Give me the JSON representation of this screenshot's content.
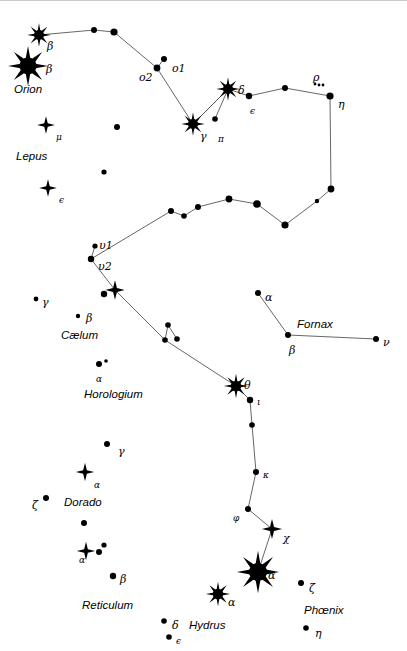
{
  "chart": {
    "width": 407,
    "height": 651,
    "background_color": "#ffffff",
    "ink_color": "#000000",
    "line_color": "#555555"
  },
  "constellation_labels": [
    {
      "name": "Orion",
      "text": "Orion",
      "x": 14,
      "y": 84
    },
    {
      "name": "Lepus",
      "text": "Lepus",
      "x": 16,
      "y": 151
    },
    {
      "name": "Caelum",
      "text": "Cælum",
      "x": 61,
      "y": 330
    },
    {
      "name": "Horologium",
      "text": "Horologium",
      "x": 84,
      "y": 389
    },
    {
      "name": "Fornax",
      "text": "Fornax",
      "x": 297,
      "y": 319
    },
    {
      "name": "Dorado",
      "text": "Dorado",
      "x": 64,
      "y": 497
    },
    {
      "name": "Reticulum",
      "text": "Reticulum",
      "x": 82,
      "y": 600
    },
    {
      "name": "Hydrus",
      "text": "Hydrus",
      "x": 189,
      "y": 620
    },
    {
      "name": "Phoenix",
      "text": "Phœnix",
      "x": 304,
      "y": 605
    }
  ],
  "star_labels": [
    {
      "name": "beta-1",
      "text": "β",
      "x": 47,
      "y": 41,
      "size": "normal"
    },
    {
      "name": "beta-2",
      "text": "β",
      "x": 46,
      "y": 64,
      "size": "normal"
    },
    {
      "name": "omicron-1",
      "text": "o1",
      "x": 172,
      "y": 63,
      "size": "normal"
    },
    {
      "name": "omicron-2",
      "text": "o2",
      "x": 139,
      "y": 72,
      "size": "normal"
    },
    {
      "name": "gamma-eri",
      "text": "γ",
      "x": 200,
      "y": 131,
      "size": "normal"
    },
    {
      "name": "pi-eri",
      "text": "π",
      "x": 218,
      "y": 135,
      "size": "sub"
    },
    {
      "name": "delta-eri",
      "text": "δ",
      "x": 238,
      "y": 85,
      "size": "normal"
    },
    {
      "name": "epsilon-eri",
      "text": "ϵ",
      "x": 250,
      "y": 107,
      "size": "sub"
    },
    {
      "name": "rho-eri",
      "text": "ρ",
      "x": 313,
      "y": 72,
      "size": "normal"
    },
    {
      "name": "eta-eri",
      "text": "η",
      "x": 338,
      "y": 99,
      "size": "normal"
    },
    {
      "name": "mu-lep",
      "text": "μ",
      "x": 56,
      "y": 133,
      "size": "sub"
    },
    {
      "name": "epsilon-lep",
      "text": "ϵ",
      "x": 59,
      "y": 196,
      "size": "sub"
    },
    {
      "name": "upsilon-1",
      "text": "υ1",
      "x": 99,
      "y": 240,
      "size": "normal"
    },
    {
      "name": "upsilon-2",
      "text": "υ2",
      "x": 98,
      "y": 261,
      "size": "normal"
    },
    {
      "name": "gamma-cae",
      "text": "γ",
      "x": 42,
      "y": 297,
      "size": "normal"
    },
    {
      "name": "beta-cae",
      "text": "β",
      "x": 86,
      "y": 313,
      "size": "normal"
    },
    {
      "name": "alpha-hor",
      "text": "α",
      "x": 96,
      "y": 375,
      "size": "sub"
    },
    {
      "name": "alpha-for",
      "text": "α",
      "x": 265,
      "y": 292,
      "size": "normal"
    },
    {
      "name": "beta-for",
      "text": "β",
      "x": 289,
      "y": 345,
      "size": "normal"
    },
    {
      "name": "nu-for",
      "text": "ν",
      "x": 383,
      "y": 337,
      "size": "normal"
    },
    {
      "name": "theta-eri",
      "text": "θ",
      "x": 244,
      "y": 380,
      "size": "normal"
    },
    {
      "name": "iota-eri",
      "text": "ι",
      "x": 257,
      "y": 398,
      "size": "sub"
    },
    {
      "name": "kappa-eri",
      "text": "κ",
      "x": 263,
      "y": 471,
      "size": "sub"
    },
    {
      "name": "phi-eri",
      "text": "φ",
      "x": 233,
      "y": 514,
      "size": "sub"
    },
    {
      "name": "chi-eri",
      "text": "χ",
      "x": 283,
      "y": 533,
      "size": "normal"
    },
    {
      "name": "alpha-eri",
      "text": "α",
      "x": 268,
      "y": 570,
      "size": "normal"
    },
    {
      "name": "gamma-dor",
      "text": "γ",
      "x": 118,
      "y": 446,
      "size": "normal"
    },
    {
      "name": "alpha-dor",
      "text": "α",
      "x": 94,
      "y": 481,
      "size": "sub"
    },
    {
      "name": "zeta-dor",
      "text": "ζ",
      "x": 32,
      "y": 500,
      "size": "normal"
    },
    {
      "name": "alpha-ret",
      "text": "α",
      "x": 79,
      "y": 556,
      "size": "sub"
    },
    {
      "name": "beta-ret",
      "text": "β",
      "x": 120,
      "y": 574,
      "size": "normal"
    },
    {
      "name": "alpha-hyi",
      "text": "α",
      "x": 228,
      "y": 597,
      "size": "normal"
    },
    {
      "name": "delta-hyi",
      "text": "δ",
      "x": 172,
      "y": 620,
      "size": "normal"
    },
    {
      "name": "epsilon-hyi",
      "text": "ϵ",
      "x": 176,
      "y": 637,
      "size": "sub"
    },
    {
      "name": "zeta-phe",
      "text": "ζ",
      "x": 309,
      "y": 583,
      "size": "normal"
    },
    {
      "name": "eta-phe",
      "text": "η",
      "x": 315,
      "y": 628,
      "size": "normal"
    }
  ],
  "chart_data": {
    "type": "scatter",
    "xlabel": "",
    "ylabel": "",
    "xlim": [
      0,
      407
    ],
    "ylim": [
      0,
      651
    ],
    "grid": false,
    "legend": "none",
    "stars": [
      {
        "id": "s-beta-ori",
        "label": "β",
        "x": 39,
        "y": 35,
        "r": 5.0,
        "style": "spiked"
      },
      {
        "id": "s-beta-ori-b",
        "label": "β",
        "x": 28,
        "y": 66,
        "r": 8.5,
        "style": "spiked"
      },
      {
        "id": "s-eri-a",
        "label": "",
        "x": 94,
        "y": 30,
        "r": 3.0,
        "style": "dot"
      },
      {
        "id": "s-eri-b",
        "label": "",
        "x": 114,
        "y": 32,
        "r": 3.6,
        "style": "dot"
      },
      {
        "id": "s-omi-1",
        "label": "o1",
        "x": 164,
        "y": 59,
        "r": 3.0,
        "style": "dot"
      },
      {
        "id": "s-omi-2",
        "label": "o2",
        "x": 157,
        "y": 68,
        "r": 3.4,
        "style": "dot"
      },
      {
        "id": "s-gamma-eri",
        "label": "γ",
        "x": 193,
        "y": 124,
        "r": 5.0,
        "style": "spiked"
      },
      {
        "id": "s-pi-eri",
        "label": "π",
        "x": 215,
        "y": 119,
        "r": 2.8,
        "style": "dot"
      },
      {
        "id": "s-delta-eri",
        "label": "δ",
        "x": 228,
        "y": 89,
        "r": 5.0,
        "style": "spiked"
      },
      {
        "id": "s-eps-eri",
        "label": "ϵ",
        "x": 249,
        "y": 96,
        "r": 3.2,
        "style": "dot"
      },
      {
        "id": "s-eri-c",
        "label": "",
        "x": 285,
        "y": 88,
        "r": 3.0,
        "style": "dot"
      },
      {
        "id": "s-eta-eri",
        "label": "η",
        "x": 330,
        "y": 96,
        "r": 3.6,
        "style": "dot"
      },
      {
        "id": "s-mu-lep",
        "label": "μ",
        "x": 46,
        "y": 125,
        "r": 4.2,
        "style": "diamond"
      },
      {
        "id": "s-eps-lep",
        "label": "ϵ",
        "x": 48,
        "y": 188,
        "r": 4.2,
        "style": "diamond"
      },
      {
        "id": "s-lep-a",
        "label": "",
        "x": 117,
        "y": 127,
        "r": 3.0,
        "style": "dot"
      },
      {
        "id": "s-lep-b",
        "label": "",
        "x": 104,
        "y": 172,
        "r": 2.6,
        "style": "dot"
      },
      {
        "id": "s-eri-d",
        "label": "",
        "x": 331,
        "y": 189,
        "r": 3.4,
        "style": "dot"
      },
      {
        "id": "s-eri-e",
        "label": "",
        "x": 317,
        "y": 201,
        "r": 2.2,
        "style": "dot"
      },
      {
        "id": "s-eri-f",
        "label": "",
        "x": 285,
        "y": 225,
        "r": 3.6,
        "style": "dot"
      },
      {
        "id": "s-eri-g",
        "label": "",
        "x": 257,
        "y": 204,
        "r": 3.8,
        "style": "dot"
      },
      {
        "id": "s-eri-h",
        "label": "",
        "x": 229,
        "y": 199,
        "r": 3.4,
        "style": "dot"
      },
      {
        "id": "s-eri-i",
        "label": "",
        "x": 198,
        "y": 207,
        "r": 3.0,
        "style": "dot"
      },
      {
        "id": "s-eri-j",
        "label": "",
        "x": 184,
        "y": 216,
        "r": 2.8,
        "style": "dot"
      },
      {
        "id": "s-eri-k",
        "label": "",
        "x": 171,
        "y": 211,
        "r": 3.0,
        "style": "dot"
      },
      {
        "id": "s-ups-1",
        "label": "υ1",
        "x": 95,
        "y": 246,
        "r": 2.6,
        "style": "dot"
      },
      {
        "id": "s-ups-2",
        "label": "υ2",
        "x": 91,
        "y": 259,
        "r": 3.2,
        "style": "dot"
      },
      {
        "id": "s-eri-l",
        "label": "",
        "x": 115,
        "y": 290,
        "r": 4.6,
        "style": "diamond"
      },
      {
        "id": "s-eri-m",
        "label": "",
        "x": 104,
        "y": 294,
        "r": 3.2,
        "style": "dot"
      },
      {
        "id": "s-gamma-cae",
        "label": "γ",
        "x": 36,
        "y": 299,
        "r": 2.4,
        "style": "dot"
      },
      {
        "id": "s-beta-cae",
        "label": "β",
        "x": 78,
        "y": 316,
        "r": 2.2,
        "style": "dot"
      },
      {
        "id": "s-alpha-hor",
        "label": "α",
        "x": 99,
        "y": 364,
        "r": 3.0,
        "style": "dot"
      },
      {
        "id": "s-alpha-hor-b",
        "label": "",
        "x": 106,
        "y": 361,
        "r": 1.8,
        "style": "dot"
      },
      {
        "id": "s-eri-n",
        "label": "",
        "x": 168,
        "y": 325,
        "r": 2.8,
        "style": "dot"
      },
      {
        "id": "s-eri-o",
        "label": "",
        "x": 165,
        "y": 340,
        "r": 2.8,
        "style": "dot"
      },
      {
        "id": "s-eri-p",
        "label": "",
        "x": 177,
        "y": 339,
        "r": 2.8,
        "style": "dot"
      },
      {
        "id": "s-theta-eri",
        "label": "θ",
        "x": 236,
        "y": 386,
        "r": 5.2,
        "style": "spiked"
      },
      {
        "id": "s-iota-eri",
        "label": "ι",
        "x": 250,
        "y": 400,
        "r": 3.2,
        "style": "dot"
      },
      {
        "id": "s-eri-q",
        "label": "",
        "x": 252,
        "y": 425,
        "r": 2.8,
        "style": "dot"
      },
      {
        "id": "s-kappa-eri",
        "label": "κ",
        "x": 256,
        "y": 472,
        "r": 3.0,
        "style": "dot"
      },
      {
        "id": "s-phi-eri",
        "label": "φ",
        "x": 248,
        "y": 509,
        "r": 3.0,
        "style": "dot"
      },
      {
        "id": "s-chi-eri",
        "label": "χ",
        "x": 272,
        "y": 529,
        "r": 4.8,
        "style": "diamond"
      },
      {
        "id": "s-alpha-eri",
        "label": "α",
        "x": 258,
        "y": 572,
        "r": 9.0,
        "style": "spiked"
      },
      {
        "id": "s-alpha-for",
        "label": "α",
        "x": 258,
        "y": 293,
        "r": 3.0,
        "style": "dot"
      },
      {
        "id": "s-beta-for",
        "label": "β",
        "x": 288,
        "y": 335,
        "r": 3.0,
        "style": "dot"
      },
      {
        "id": "s-nu-for",
        "label": "ν",
        "x": 376,
        "y": 339,
        "r": 3.0,
        "style": "dot"
      },
      {
        "id": "s-gamma-dor",
        "label": "γ",
        "x": 107,
        "y": 444,
        "r": 3.0,
        "style": "dot"
      },
      {
        "id": "s-alpha-dor",
        "label": "α",
        "x": 85,
        "y": 472,
        "r": 4.4,
        "style": "diamond"
      },
      {
        "id": "s-zeta-dor",
        "label": "ζ",
        "x": 46,
        "y": 498,
        "r": 3.0,
        "style": "dot"
      },
      {
        "id": "s-dor-a",
        "label": "",
        "x": 84,
        "y": 523,
        "r": 3.0,
        "style": "dot"
      },
      {
        "id": "s-alpha-ret",
        "label": "α",
        "x": 86,
        "y": 551,
        "r": 4.4,
        "style": "diamond"
      },
      {
        "id": "s-ret-a",
        "label": "",
        "x": 99,
        "y": 552,
        "r": 3.0,
        "style": "dot"
      },
      {
        "id": "s-ret-b",
        "label": "",
        "x": 104,
        "y": 545,
        "r": 2.6,
        "style": "dot"
      },
      {
        "id": "s-beta-ret",
        "label": "β",
        "x": 113,
        "y": 576,
        "r": 3.2,
        "style": "dot"
      },
      {
        "id": "s-alpha-hyi",
        "label": "α",
        "x": 218,
        "y": 594,
        "r": 5.2,
        "style": "spiked"
      },
      {
        "id": "s-delta-hyi",
        "label": "δ",
        "x": 164,
        "y": 621,
        "r": 2.8,
        "style": "dot"
      },
      {
        "id": "s-eps-hyi",
        "label": "ϵ",
        "x": 169,
        "y": 637,
        "r": 2.8,
        "style": "dot"
      },
      {
        "id": "s-zeta-phe",
        "label": "ζ",
        "x": 301,
        "y": 583,
        "r": 3.0,
        "style": "dot"
      },
      {
        "id": "s-eta-phe",
        "label": "η",
        "x": 306,
        "y": 628,
        "r": 2.8,
        "style": "dot"
      },
      {
        "id": "s-rho-a",
        "label": "",
        "x": 315,
        "y": 84,
        "r": 1.4,
        "style": "dot"
      },
      {
        "id": "s-rho-b",
        "label": "",
        "x": 319,
        "y": 85,
        "r": 1.4,
        "style": "dot"
      },
      {
        "id": "s-rho-c",
        "label": "",
        "x": 323,
        "y": 85,
        "r": 1.4,
        "style": "dot"
      }
    ],
    "lines": [
      {
        "name": "eridanus-main",
        "points": [
          [
            39,
            35
          ],
          [
            94,
            30
          ],
          [
            114,
            32
          ],
          [
            157,
            68
          ],
          [
            193,
            124
          ],
          [
            228,
            89
          ],
          [
            249,
            96
          ],
          [
            285,
            88
          ],
          [
            330,
            96
          ],
          [
            331,
            189
          ],
          [
            317,
            201
          ],
          [
            285,
            225
          ],
          [
            257,
            204
          ],
          [
            229,
            199
          ],
          [
            198,
            207
          ],
          [
            184,
            216
          ],
          [
            171,
            211
          ],
          [
            91,
            259
          ],
          [
            115,
            290
          ],
          [
            165,
            340
          ],
          [
            236,
            386
          ],
          [
            250,
            400
          ],
          [
            252,
            425
          ],
          [
            256,
            472
          ],
          [
            248,
            509
          ],
          [
            272,
            529
          ],
          [
            258,
            572
          ]
        ]
      },
      {
        "name": "eri-omicron-branch",
        "points": [
          [
            157,
            68
          ],
          [
            164,
            59
          ]
        ]
      },
      {
        "name": "eri-pi-branch",
        "points": [
          [
            228,
            89
          ],
          [
            215,
            119
          ]
        ]
      },
      {
        "name": "eri-gamma-delta",
        "points": [
          [
            193,
            124
          ],
          [
            228,
            89
          ]
        ]
      },
      {
        "name": "eri-upsilon-branch",
        "points": [
          [
            91,
            259
          ],
          [
            95,
            246
          ]
        ]
      },
      {
        "name": "hor-branch",
        "points": [
          [
            165,
            340
          ],
          [
            168,
            325
          ]
        ]
      },
      {
        "name": "hor-branch-b",
        "points": [
          [
            168,
            325
          ],
          [
            177,
            339
          ]
        ]
      },
      {
        "name": "fornax-figure",
        "points": [
          [
            258,
            293
          ],
          [
            288,
            335
          ],
          [
            376,
            339
          ]
        ]
      }
    ]
  }
}
